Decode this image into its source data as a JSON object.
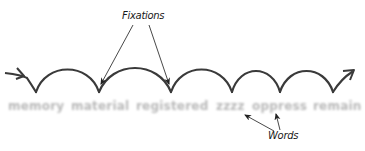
{
  "diagram": {
    "title_labels": {
      "fixations": "Fixations",
      "words": "Words"
    },
    "words": [
      {
        "text": "memory",
        "x": 8
      },
      {
        "text": "material",
        "x": 71
      },
      {
        "text": "registered",
        "x": 136
      },
      {
        "text": "zzzz",
        "x": 216
      },
      {
        "text": "oppress",
        "x": 252
      },
      {
        "text": "remain",
        "x": 313
      }
    ],
    "fixation_points": [
      {
        "x": 36,
        "y": 92
      },
      {
        "x": 99,
        "y": 92
      },
      {
        "x": 171,
        "y": 92
      },
      {
        "x": 232,
        "y": 92
      },
      {
        "x": 280,
        "y": 92
      },
      {
        "x": 333,
        "y": 92
      }
    ],
    "colors": {
      "stroke": "#3a3a3a",
      "word_gray": "#b9b9b9",
      "background": "#ffffff"
    }
  }
}
